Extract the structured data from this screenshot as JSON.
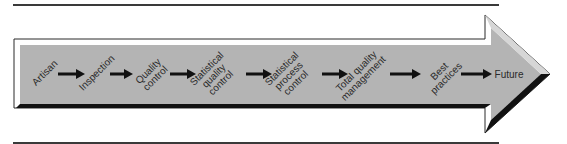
{
  "colors": {
    "fill": "#b4b4b4",
    "outline": "#2a2a2a",
    "shadow": "#111111",
    "highlight": "#ffffff",
    "rule": "#3a3a3a",
    "text": "#2a2a2a"
  },
  "stages": [
    {
      "lines": [
        "Artisan"
      ],
      "x": 45,
      "y": 73,
      "rotated": true
    },
    {
      "lines": [
        "Inspection"
      ],
      "x": 97,
      "y": 73,
      "rotated": true
    },
    {
      "lines": [
        "Quality",
        "control"
      ],
      "x": 152,
      "y": 75,
      "rotated": true
    },
    {
      "lines": [
        "Statistical",
        "quality",
        "control"
      ],
      "x": 214,
      "y": 76,
      "rotated": true
    },
    {
      "lines": [
        "Statistical",
        "process",
        "control"
      ],
      "x": 289,
      "y": 76,
      "rotated": true
    },
    {
      "lines": [
        "Total quality",
        "management"
      ],
      "x": 360,
      "y": 75,
      "rotated": true
    },
    {
      "lines": [
        "Best",
        "practices"
      ],
      "x": 443,
      "y": 75,
      "rotated": true
    },
    {
      "lines": [
        "Future"
      ],
      "x": 509,
      "y": 75,
      "rotated": false
    }
  ],
  "connectors": [
    {
      "x1": 58,
      "x2": 85,
      "y": 74
    },
    {
      "x1": 110,
      "x2": 133,
      "y": 74
    },
    {
      "x1": 170,
      "x2": 196,
      "y": 74
    },
    {
      "x1": 246,
      "x2": 272,
      "y": 74
    },
    {
      "x1": 322,
      "x2": 348,
      "y": 74
    },
    {
      "x1": 390,
      "x2": 421,
      "y": 74
    },
    {
      "x1": 461,
      "x2": 492,
      "y": 74
    }
  ]
}
